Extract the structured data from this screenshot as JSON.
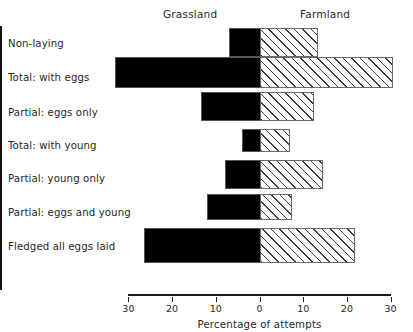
{
  "chart_data": {
    "type": "bar",
    "orientation": "horizontal",
    "layout": "diverging-pyramid",
    "title": "",
    "xlabel": "Percentage of attempts",
    "ylabel": "",
    "xlim": [
      -30,
      30
    ],
    "xticks": [
      30,
      20,
      10,
      0,
      10,
      20,
      30
    ],
    "grid": false,
    "legend_position": "top",
    "categories": [
      "Non-laying",
      "Total: with eggs",
      "Partial: eggs only",
      "Total: with young",
      "Partial: young only",
      "Partial: eggs and young",
      "Fledged all eggs laid"
    ],
    "series": [
      {
        "name": "Grassland",
        "side": "left",
        "fill": "solid-black",
        "color": "#000000",
        "values": [
          7,
          33,
          13.5,
          4,
          8,
          12,
          26.5
        ]
      },
      {
        "name": "Farmland",
        "side": "right",
        "fill": "diagonal-hatch",
        "color": "#ffffff",
        "values": [
          13,
          30,
          12,
          6.5,
          14,
          7,
          21.5
        ]
      }
    ]
  },
  "header": {
    "grassland_label": "Grassland",
    "farmland_label": "Farmland"
  },
  "axis": {
    "title": "Percentage of attempts",
    "tick_labels": [
      "30",
      "20",
      "10",
      "0",
      "10",
      "20",
      "30"
    ]
  }
}
